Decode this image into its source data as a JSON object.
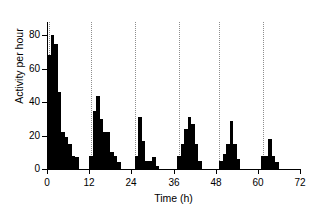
{
  "chart_data": {
    "type": "bar",
    "title": "",
    "xlabel": "Time (h)",
    "ylabel": "Activity per hour",
    "xlim": [
      0,
      72
    ],
    "ylim": [
      0,
      88
    ],
    "grid": "vertical-dotted-onset-lines",
    "legend": "none",
    "bar_width_hours": 1,
    "xticks": [
      0,
      12,
      24,
      36,
      48,
      60,
      72
    ],
    "xtick_labels": [
      "0",
      "12",
      "24",
      "36",
      "48",
      "60",
      "72"
    ],
    "yticks": [
      0,
      20,
      40,
      60,
      80
    ],
    "ytick_labels": [
      "0",
      "20",
      "40",
      "60",
      "80"
    ],
    "onset_gridlines_hours": [
      0.5,
      12.5,
      25.0,
      37.5,
      49.0,
      61.5
    ],
    "series": [
      {
        "name": "Activity per hour",
        "color": "#000000",
        "x": [
          0,
          1,
          2,
          3,
          4,
          5,
          6,
          7,
          8,
          12,
          13,
          14,
          15,
          16,
          17,
          18,
          19,
          20,
          25,
          26,
          27,
          28,
          29,
          30,
          31,
          37,
          38,
          39,
          40,
          41,
          42,
          43,
          49,
          50,
          51,
          52,
          53,
          54,
          61,
          62,
          63,
          64,
          65
        ],
        "values": [
          68,
          80,
          75,
          46,
          22,
          19,
          15,
          8,
          7,
          8,
          35,
          44,
          30,
          22,
          22,
          10,
          8,
          4,
          8,
          31,
          17,
          5,
          5,
          7,
          2,
          8,
          15,
          24,
          31,
          27,
          15,
          5,
          5,
          9,
          15,
          29,
          15,
          6,
          8,
          8,
          18,
          8,
          4
        ]
      }
    ]
  }
}
